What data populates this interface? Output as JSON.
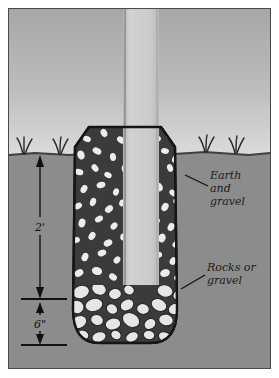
{
  "figure": {
    "type": "cross-section-diagram"
  },
  "colors": {
    "paper": "#ffffff",
    "frame_border": "#4a4a4a",
    "sky_top": "#a9a9a9",
    "sky_bottom": "#d8d8d8",
    "earth": "#8c8c8c",
    "earth_line": "#3f3f3f",
    "backfill_dark": "#3b3b3b",
    "pebble_light": "#ececec",
    "rock_light": "#e6e6e6",
    "post_face": "#cfcfcf",
    "post_shade": "#bdbdbd",
    "post_edge": "#8e8e8e",
    "ink": "#141414"
  },
  "labels": {
    "earth_and_gravel": {
      "line1": "Earth",
      "line2": "and",
      "line3": "gravel"
    },
    "rocks_or_gravel": {
      "line1": "Rocks or",
      "line2": "gravel"
    }
  },
  "dimensions": [
    {
      "name": "depth-of-backfill",
      "value": "2'"
    },
    {
      "name": "depth-of-rock-bed",
      "value": "6\""
    }
  ],
  "elements": {
    "post_label": "post",
    "grass_label": "grass-tuft",
    "hole_label": "post-hole",
    "sky_label": "sky",
    "ground_label": "ground"
  }
}
